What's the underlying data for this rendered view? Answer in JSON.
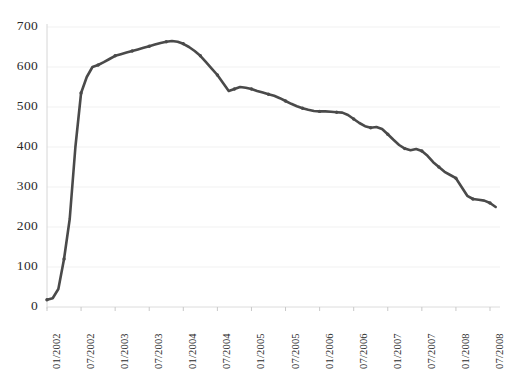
{
  "chart_data": {
    "type": "line",
    "title": "",
    "xlabel": "",
    "ylabel": "",
    "ylim": [
      0,
      700
    ],
    "ytick_step": 100,
    "ytick_labels": [
      "0",
      "100",
      "200",
      "300",
      "400",
      "500",
      "600",
      "700"
    ],
    "ytick_values": [
      0,
      100,
      200,
      300,
      400,
      500,
      600,
      700
    ],
    "xtick_labels": [
      "01/2002",
      "07/2002",
      "01/2003",
      "07/2003",
      "01/2004",
      "07/2004",
      "01/2005",
      "07/2005",
      "01/2006",
      "07/2006",
      "01/2007",
      "07/2007",
      "01/2008",
      "07/2008"
    ],
    "grid": true,
    "grid_color": "#f1f1f1",
    "legend": "none",
    "series": [
      {
        "name": "series-1",
        "color": "#4a4a4a",
        "marker": "small-dot",
        "x": [
          "01/2002",
          "02/2002",
          "03/2002",
          "04/2002",
          "05/2002",
          "06/2002",
          "07/2002",
          "08/2002",
          "09/2002",
          "10/2002",
          "11/2002",
          "12/2002",
          "01/2003",
          "02/2003",
          "03/2003",
          "04/2003",
          "05/2003",
          "06/2003",
          "07/2003",
          "08/2003",
          "09/2003",
          "10/2003",
          "11/2003",
          "12/2003",
          "01/2004",
          "02/2004",
          "03/2004",
          "04/2004",
          "05/2004",
          "06/2004",
          "07/2004",
          "08/2004",
          "09/2004",
          "10/2004",
          "11/2004",
          "12/2004",
          "01/2005",
          "02/2005",
          "03/2005",
          "04/2005",
          "05/2005",
          "06/2005",
          "07/2005",
          "08/2005",
          "09/2005",
          "10/2005",
          "11/2005",
          "12/2005",
          "01/2006",
          "02/2006",
          "03/2006",
          "04/2006",
          "05/2006",
          "06/2006",
          "07/2006",
          "08/2006",
          "09/2006",
          "10/2006",
          "11/2006",
          "12/2006",
          "01/2007",
          "02/2007",
          "03/2007",
          "04/2007",
          "05/2007",
          "06/2007",
          "07/2007",
          "08/2007",
          "09/2007",
          "10/2007",
          "11/2007",
          "12/2007",
          "01/2008",
          "02/2008",
          "03/2008",
          "04/2008",
          "05/2008",
          "06/2008",
          "07/2008",
          "08/2008"
        ],
        "values": [
          18,
          22,
          45,
          120,
          220,
          400,
          535,
          575,
          600,
          605,
          612,
          620,
          628,
          632,
          636,
          640,
          644,
          648,
          652,
          656,
          660,
          663,
          665,
          663,
          658,
          650,
          640,
          628,
          612,
          596,
          580,
          560,
          540,
          545,
          550,
          548,
          545,
          540,
          536,
          532,
          528,
          522,
          515,
          508,
          502,
          497,
          493,
          490,
          489,
          489,
          488,
          487,
          486,
          480,
          470,
          460,
          452,
          448,
          450,
          445,
          432,
          418,
          405,
          396,
          392,
          395,
          390,
          378,
          362,
          350,
          338,
          330,
          322,
          300,
          278,
          270,
          268,
          266,
          260,
          250
        ]
      }
    ]
  },
  "axis": {
    "y_labels": [
      "700",
      "600",
      "500",
      "400",
      "300",
      "200",
      "100",
      "0"
    ],
    "x_labels": [
      "01/2002",
      "07/2002",
      "01/2003",
      "07/2003",
      "01/2004",
      "07/2004",
      "01/2005",
      "07/2005",
      "01/2006",
      "07/2006",
      "01/2007",
      "07/2007",
      "01/2008",
      "07/2008"
    ]
  },
  "colors": {
    "line": "#4a4a4a",
    "grid": "#f1f1f1",
    "axis": "#d8d8d8",
    "text": "#2b2b2b",
    "background": "#ffffff"
  }
}
